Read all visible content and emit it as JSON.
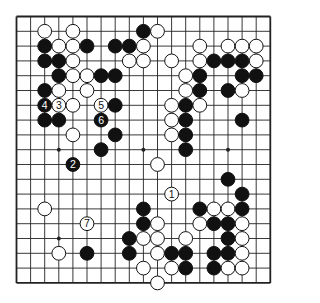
{
  "diagram": {
    "type": "go-board",
    "size": 19,
    "colors": {
      "black": "#111111",
      "white": "#ffffff",
      "line": "#222222",
      "background": "#ffffff"
    },
    "star_points": [
      [
        3,
        3
      ],
      [
        3,
        9
      ],
      [
        3,
        15
      ],
      [
        9,
        3
      ],
      [
        9,
        9
      ],
      [
        9,
        15
      ],
      [
        15,
        3
      ],
      [
        15,
        9
      ],
      [
        15,
        15
      ]
    ],
    "stones": [
      {
        "r": 1,
        "c": 2,
        "color": "W"
      },
      {
        "r": 1,
        "c": 4,
        "color": "W"
      },
      {
        "r": 1,
        "c": 9,
        "color": "B"
      },
      {
        "r": 1,
        "c": 10,
        "color": "W"
      },
      {
        "r": 2,
        "c": 2,
        "color": "B"
      },
      {
        "r": 2,
        "c": 3,
        "color": "W"
      },
      {
        "r": 2,
        "c": 4,
        "color": "W"
      },
      {
        "r": 2,
        "c": 5,
        "color": "B"
      },
      {
        "r": 2,
        "c": 7,
        "color": "B"
      },
      {
        "r": 2,
        "c": 8,
        "color": "B"
      },
      {
        "r": 2,
        "c": 9,
        "color": "W"
      },
      {
        "r": 2,
        "c": 13,
        "color": "W"
      },
      {
        "r": 2,
        "c": 15,
        "color": "W"
      },
      {
        "r": 2,
        "c": 16,
        "color": "W"
      },
      {
        "r": 2,
        "c": 17,
        "color": "W"
      },
      {
        "r": 3,
        "c": 2,
        "color": "B"
      },
      {
        "r": 3,
        "c": 3,
        "color": "B"
      },
      {
        "r": 3,
        "c": 4,
        "color": "W"
      },
      {
        "r": 3,
        "c": 8,
        "color": "W"
      },
      {
        "r": 3,
        "c": 9,
        "color": "W"
      },
      {
        "r": 3,
        "c": 11,
        "color": "W"
      },
      {
        "r": 3,
        "c": 13,
        "color": "W"
      },
      {
        "r": 3,
        "c": 14,
        "color": "B"
      },
      {
        "r": 3,
        "c": 15,
        "color": "B"
      },
      {
        "r": 3,
        "c": 16,
        "color": "B"
      },
      {
        "r": 3,
        "c": 17,
        "color": "W"
      },
      {
        "r": 4,
        "c": 3,
        "color": "B"
      },
      {
        "r": 4,
        "c": 4,
        "color": "W"
      },
      {
        "r": 4,
        "c": 5,
        "color": "W"
      },
      {
        "r": 4,
        "c": 6,
        "color": "B"
      },
      {
        "r": 4,
        "c": 7,
        "color": "B"
      },
      {
        "r": 4,
        "c": 12,
        "color": "W"
      },
      {
        "r": 4,
        "c": 13,
        "color": "B"
      },
      {
        "r": 4,
        "c": 16,
        "color": "B"
      },
      {
        "r": 4,
        "c": 17,
        "color": "B"
      },
      {
        "r": 5,
        "c": 2,
        "color": "B"
      },
      {
        "r": 5,
        "c": 3,
        "color": "W"
      },
      {
        "r": 5,
        "c": 5,
        "color": "W"
      },
      {
        "r": 5,
        "c": 12,
        "color": "W"
      },
      {
        "r": 5,
        "c": 13,
        "color": "B"
      },
      {
        "r": 5,
        "c": 15,
        "color": "B"
      },
      {
        "r": 5,
        "c": 16,
        "color": "W"
      },
      {
        "r": 6,
        "c": 2,
        "color": "B",
        "label": "4"
      },
      {
        "r": 6,
        "c": 3,
        "color": "W",
        "label": "3"
      },
      {
        "r": 6,
        "c": 4,
        "color": "W"
      },
      {
        "r": 6,
        "c": 6,
        "color": "W",
        "label": "5"
      },
      {
        "r": 6,
        "c": 7,
        "color": "B"
      },
      {
        "r": 6,
        "c": 11,
        "color": "W"
      },
      {
        "r": 6,
        "c": 12,
        "color": "B"
      },
      {
        "r": 6,
        "c": 13,
        "color": "W"
      },
      {
        "r": 7,
        "c": 2,
        "color": "B"
      },
      {
        "r": 7,
        "c": 3,
        "color": "B"
      },
      {
        "r": 7,
        "c": 6,
        "color": "B",
        "label": "6"
      },
      {
        "r": 7,
        "c": 11,
        "color": "W"
      },
      {
        "r": 7,
        "c": 12,
        "color": "B"
      },
      {
        "r": 7,
        "c": 16,
        "color": "B"
      },
      {
        "r": 8,
        "c": 4,
        "color": "W"
      },
      {
        "r": 8,
        "c": 7,
        "color": "B"
      },
      {
        "r": 8,
        "c": 11,
        "color": "W"
      },
      {
        "r": 8,
        "c": 12,
        "color": "B"
      },
      {
        "r": 9,
        "c": 6,
        "color": "B"
      },
      {
        "r": 9,
        "c": 12,
        "color": "B"
      },
      {
        "r": 10,
        "c": 4,
        "color": "B",
        "label": "2"
      },
      {
        "r": 10,
        "c": 10,
        "color": "W"
      },
      {
        "r": 11,
        "c": 15,
        "color": "B"
      },
      {
        "r": 12,
        "c": 11,
        "color": "W",
        "label": "1"
      },
      {
        "r": 12,
        "c": 16,
        "color": "B"
      },
      {
        "r": 13,
        "c": 2,
        "color": "W"
      },
      {
        "r": 13,
        "c": 9,
        "color": "B"
      },
      {
        "r": 13,
        "c": 13,
        "color": "B"
      },
      {
        "r": 13,
        "c": 14,
        "color": "W"
      },
      {
        "r": 13,
        "c": 15,
        "color": "W"
      },
      {
        "r": 13,
        "c": 16,
        "color": "B"
      },
      {
        "r": 14,
        "c": 5,
        "color": "W",
        "label": "7"
      },
      {
        "r": 14,
        "c": 9,
        "color": "B"
      },
      {
        "r": 14,
        "c": 10,
        "color": "W"
      },
      {
        "r": 14,
        "c": 13,
        "color": "W"
      },
      {
        "r": 14,
        "c": 14,
        "color": "B"
      },
      {
        "r": 14,
        "c": 15,
        "color": "B"
      },
      {
        "r": 14,
        "c": 16,
        "color": "W"
      },
      {
        "r": 15,
        "c": 8,
        "color": "B"
      },
      {
        "r": 15,
        "c": 9,
        "color": "W"
      },
      {
        "r": 15,
        "c": 10,
        "color": "W"
      },
      {
        "r": 15,
        "c": 12,
        "color": "W"
      },
      {
        "r": 15,
        "c": 15,
        "color": "B"
      },
      {
        "r": 15,
        "c": 16,
        "color": "W"
      },
      {
        "r": 16,
        "c": 3,
        "color": "W"
      },
      {
        "r": 16,
        "c": 5,
        "color": "B"
      },
      {
        "r": 16,
        "c": 8,
        "color": "B"
      },
      {
        "r": 16,
        "c": 10,
        "color": "W"
      },
      {
        "r": 16,
        "c": 11,
        "color": "B"
      },
      {
        "r": 16,
        "c": 12,
        "color": "B"
      },
      {
        "r": 16,
        "c": 14,
        "color": "B"
      },
      {
        "r": 16,
        "c": 15,
        "color": "B"
      },
      {
        "r": 16,
        "c": 16,
        "color": "W"
      },
      {
        "r": 17,
        "c": 9,
        "color": "W"
      },
      {
        "r": 17,
        "c": 11,
        "color": "W"
      },
      {
        "r": 17,
        "c": 12,
        "color": "B"
      },
      {
        "r": 17,
        "c": 14,
        "color": "B"
      },
      {
        "r": 17,
        "c": 15,
        "color": "W"
      },
      {
        "r": 17,
        "c": 16,
        "color": "W"
      },
      {
        "r": 18,
        "c": 10,
        "color": "W"
      }
    ],
    "move_labels": [
      "1",
      "2",
      "3",
      "4",
      "5",
      "6",
      "7"
    ]
  }
}
